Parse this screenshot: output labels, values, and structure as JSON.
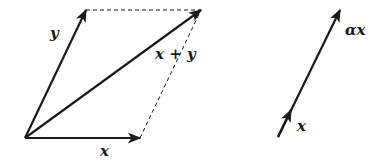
{
  "diagram": {
    "colors": {
      "stroke": "#1a1a1a",
      "background": "#ffffff"
    },
    "parallelogram": {
      "origin": [
        25,
        138
      ],
      "x_tip": [
        140,
        138
      ],
      "y_tip": [
        86,
        10
      ],
      "sum_tip": [
        201,
        10
      ],
      "labels": {
        "x": "x",
        "y": "y",
        "sum": "x + y"
      }
    },
    "scaling": {
      "start": [
        278,
        137
      ],
      "x_tip": [
        291,
        110
      ],
      "alpha_x_tip": [
        340,
        10
      ],
      "labels": {
        "x": "x",
        "alpha_x": "αx"
      }
    }
  }
}
